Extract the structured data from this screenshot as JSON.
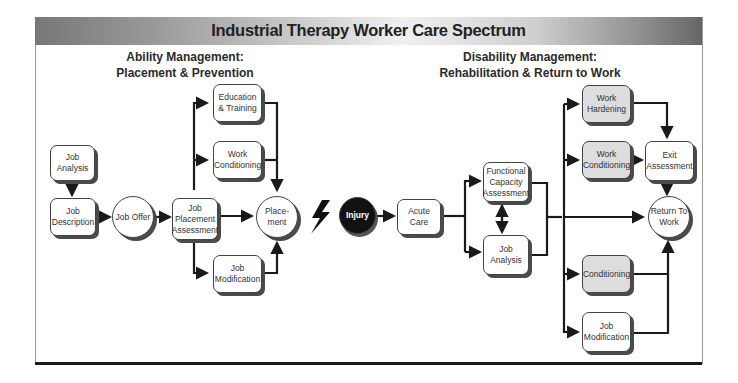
{
  "header": {
    "title": "Industrial Therapy Worker Care Spectrum"
  },
  "sections": {
    "ability": {
      "line1": "Ability Management:",
      "line2": "Placement & Prevention"
    },
    "disability": {
      "line1": "Disability Management:",
      "line2": "Rehabilitation & Return to Work"
    }
  },
  "ability_nodes": {
    "job_analysis": "Job Analysis",
    "job_description": "Job Description",
    "job_offer": "Job Offer",
    "job_placement_assessment": "Job Placement Assessment",
    "education_training": "Education & Training",
    "work_conditioning": "Work Conditioning",
    "job_modification": "Job Modification",
    "placement": "Place- ment"
  },
  "transition": {
    "icon": "lightning-bolt-icon",
    "injury": "Injury"
  },
  "disability_nodes": {
    "acute_care": "Acute Care",
    "functional_capacity_assessment": "Functional Capacity Assessment",
    "job_analysis": "Job Analysis",
    "work_hardening": "Work Hardening",
    "work_conditioning": "Work Conditioning",
    "exit_assessment": "Exit Assessment",
    "return_to_work": "Return To Work",
    "conditioning": "Conditioning",
    "job_modification": "Job Modification"
  },
  "colors": {
    "shaded_node": "#dddddd",
    "injury": "#111111",
    "line": "#1a1a1a"
  }
}
